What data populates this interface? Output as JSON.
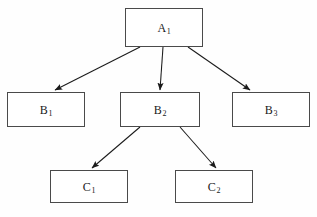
{
  "diagram": {
    "type": "hierarchy-tree",
    "levels": 3,
    "canvas": {
      "width": 317,
      "height": 217
    },
    "style": {
      "background_color": "#fefefe",
      "node_fill": "#ffffff",
      "node_border_color": "#4a4a4a",
      "edge_color": "#1a1a1a",
      "text_color": "#1a1a1a"
    },
    "nodes": [
      {
        "id": "A1",
        "base": "A",
        "subscript": "1",
        "level": 1,
        "x": 125,
        "y": 8,
        "width": 78,
        "height": 39
      },
      {
        "id": "B1",
        "base": "B",
        "subscript": "1",
        "level": 2,
        "x": 7,
        "y": 92,
        "width": 78,
        "height": 35
      },
      {
        "id": "B2",
        "base": "B",
        "subscript": "2",
        "level": 2,
        "x": 120,
        "y": 92,
        "width": 80,
        "height": 35
      },
      {
        "id": "B3",
        "base": "B",
        "subscript": "3",
        "level": 2,
        "x": 232,
        "y": 92,
        "width": 78,
        "height": 35
      },
      {
        "id": "C1",
        "base": "C",
        "subscript": "1",
        "level": 3,
        "x": 50,
        "y": 170,
        "width": 78,
        "height": 33
      },
      {
        "id": "C2",
        "base": "C",
        "subscript": "2",
        "level": 3,
        "x": 175,
        "y": 170,
        "width": 78,
        "height": 33
      }
    ],
    "edges": [
      {
        "id": "A1-B1",
        "from": "A1",
        "to": "B1",
        "x1": 140,
        "y1": 47,
        "x2": 55,
        "y2": 90,
        "arrowhead": "filled-triangle"
      },
      {
        "id": "A1-B2",
        "from": "A1",
        "to": "B2",
        "x1": 163,
        "y1": 47,
        "x2": 160,
        "y2": 90,
        "arrowhead": "filled-triangle"
      },
      {
        "id": "A1-B3",
        "from": "A1",
        "to": "B3",
        "x1": 188,
        "y1": 47,
        "x2": 250,
        "y2": 90,
        "arrowhead": "filled-triangle"
      },
      {
        "id": "B2-C1",
        "from": "B2",
        "to": "C1",
        "x1": 140,
        "y1": 127,
        "x2": 92,
        "y2": 168,
        "arrowhead": "filled-triangle"
      },
      {
        "id": "B2-C2",
        "from": "B2",
        "to": "C2",
        "x1": 180,
        "y1": 127,
        "x2": 216,
        "y2": 168,
        "arrowhead": "filled-triangle"
      }
    ]
  }
}
